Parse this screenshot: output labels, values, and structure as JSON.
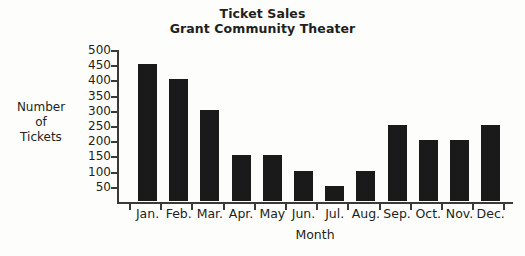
{
  "chart_data": {
    "type": "bar",
    "title": "Ticket Sales",
    "subtitle": "Grant Community Theater",
    "xlabel": "Month",
    "ylabel": "Number of Tickets",
    "ylabel_lines": [
      "Number",
      "of",
      "Tickets"
    ],
    "categories": [
      "Jan.",
      "Feb.",
      "Mar.",
      "Apr.",
      "May",
      "Jun.",
      "Jul.",
      "Aug.",
      "Sep.",
      "Oct.",
      "Nov.",
      "Dec."
    ],
    "values": [
      450,
      400,
      300,
      150,
      150,
      100,
      50,
      100,
      250,
      200,
      200,
      250
    ],
    "ylim": [
      0,
      500
    ],
    "yticks": [
      500,
      450,
      400,
      350,
      300,
      250,
      200,
      150,
      100,
      50
    ],
    "ytick_labels": [
      "500",
      "450",
      "400",
      "350",
      "300",
      "250",
      "200",
      "150",
      "100",
      "50"
    ],
    "grid": false,
    "legend": null,
    "bar_color": "#1a1a1a",
    "axis_color": "#3a3a3a",
    "background_color": "#fdfdfc"
  }
}
